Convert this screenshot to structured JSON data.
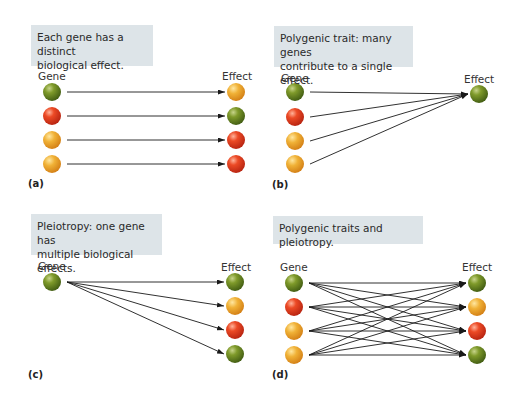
{
  "colors": {
    "green": "#6b8a1e",
    "red": "#e03a1f",
    "orange": "#eda42a",
    "box_bg": "#dde4e8",
    "line": "#1a1a1a"
  },
  "panels": [
    {
      "id": "a",
      "letter": "(a)",
      "caption": [
        "Each gene has a distinct",
        "biological effect."
      ],
      "gene_label": "Gene",
      "effect_label": "Effect",
      "box": {
        "x": 31,
        "y": 25,
        "w": 122,
        "h": 41
      },
      "gene_label_pos": {
        "x": 38,
        "y": 70
      },
      "effect_label_pos": {
        "x": 222,
        "y": 70
      },
      "letter_pos": {
        "x": 28,
        "y": 178
      },
      "genes": [
        {
          "x": 52,
          "y": 92,
          "color": "green"
        },
        {
          "x": 52,
          "y": 116,
          "color": "red"
        },
        {
          "x": 52,
          "y": 140,
          "color": "orange"
        },
        {
          "x": 52,
          "y": 164,
          "color": "orange"
        }
      ],
      "effects": [
        {
          "x": 236,
          "y": 92,
          "color": "orange"
        },
        {
          "x": 236,
          "y": 116,
          "color": "green"
        },
        {
          "x": 236,
          "y": 140,
          "color": "red"
        },
        {
          "x": 236,
          "y": 164,
          "color": "red"
        }
      ],
      "links": [
        [
          0,
          0
        ],
        [
          1,
          1
        ],
        [
          2,
          2
        ],
        [
          3,
          3
        ]
      ]
    },
    {
      "id": "b",
      "letter": "(b)",
      "caption": [
        "Polygenic trait: many genes",
        "contribute to a single effect."
      ],
      "gene_label": "Gene",
      "effect_label": "Effect",
      "box": {
        "x": 274,
        "y": 26,
        "w": 139,
        "h": 41
      },
      "gene_label_pos": {
        "x": 281,
        "y": 72
      },
      "effect_label_pos": {
        "x": 464,
        "y": 73
      },
      "letter_pos": {
        "x": 272,
        "y": 179
      },
      "genes": [
        {
          "x": 295,
          "y": 92,
          "color": "green"
        },
        {
          "x": 295,
          "y": 117,
          "color": "red"
        },
        {
          "x": 295,
          "y": 141,
          "color": "orange"
        },
        {
          "x": 295,
          "y": 164,
          "color": "orange"
        }
      ],
      "effects": [
        {
          "x": 479,
          "y": 94,
          "color": "green"
        }
      ],
      "links": [
        [
          0,
          0
        ],
        [
          1,
          0
        ],
        [
          2,
          0
        ],
        [
          3,
          0
        ]
      ]
    },
    {
      "id": "c",
      "letter": "(c)",
      "caption": [
        "Pleiotropy: one gene has",
        "multiple biological effects."
      ],
      "gene_label": "Gene",
      "effect_label": "Effect",
      "box": {
        "x": 31,
        "y": 214,
        "w": 131,
        "h": 41
      },
      "gene_label_pos": {
        "x": 38,
        "y": 260
      },
      "effect_label_pos": {
        "x": 221,
        "y": 261
      },
      "letter_pos": {
        "x": 28,
        "y": 369
      },
      "genes": [
        {
          "x": 52,
          "y": 282,
          "color": "green"
        }
      ],
      "effects": [
        {
          "x": 235,
          "y": 282,
          "color": "green"
        },
        {
          "x": 235,
          "y": 306,
          "color": "orange"
        },
        {
          "x": 235,
          "y": 330,
          "color": "red"
        },
        {
          "x": 235,
          "y": 354,
          "color": "green"
        }
      ],
      "links": [
        [
          0,
          0
        ],
        [
          0,
          1
        ],
        [
          0,
          2
        ],
        [
          0,
          3
        ]
      ]
    },
    {
      "id": "d",
      "letter": "(d)",
      "caption": [
        "Polygenic traits and pleiotropy."
      ],
      "gene_label": "Gene",
      "effect_label": "Effect",
      "box": {
        "x": 273,
        "y": 216,
        "w": 150,
        "h": 28
      },
      "gene_label_pos": {
        "x": 280,
        "y": 261
      },
      "effect_label_pos": {
        "x": 462,
        "y": 261
      },
      "letter_pos": {
        "x": 272,
        "y": 369
      },
      "genes": [
        {
          "x": 294,
          "y": 283,
          "color": "green"
        },
        {
          "x": 294,
          "y": 307,
          "color": "red"
        },
        {
          "x": 294,
          "y": 331,
          "color": "orange"
        },
        {
          "x": 294,
          "y": 355,
          "color": "orange"
        }
      ],
      "effects": [
        {
          "x": 477,
          "y": 283,
          "color": "green"
        },
        {
          "x": 477,
          "y": 307,
          "color": "orange"
        },
        {
          "x": 477,
          "y": 331,
          "color": "red"
        },
        {
          "x": 477,
          "y": 355,
          "color": "green"
        }
      ],
      "links": [
        [
          0,
          0
        ],
        [
          0,
          1
        ],
        [
          0,
          2
        ],
        [
          0,
          3
        ],
        [
          1,
          0
        ],
        [
          1,
          1
        ],
        [
          1,
          2
        ],
        [
          1,
          3
        ],
        [
          2,
          0
        ],
        [
          2,
          1
        ],
        [
          2,
          2
        ],
        [
          2,
          3
        ],
        [
          3,
          0
        ],
        [
          3,
          1
        ],
        [
          3,
          2
        ],
        [
          3,
          3
        ]
      ]
    }
  ],
  "ball_radius": 9
}
